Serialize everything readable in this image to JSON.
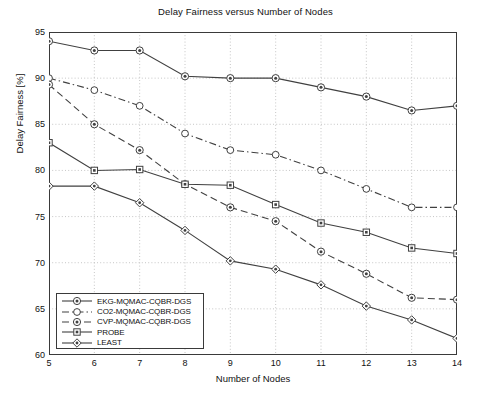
{
  "chart_data": {
    "type": "line",
    "title": "Delay Fairness versus Number of Nodes",
    "xlabel": "Number of Nodes",
    "ylabel": "Delay Fairness [%]",
    "x": [
      5,
      6,
      7,
      8,
      9,
      10,
      11,
      12,
      13,
      14
    ],
    "xlim": [
      5,
      14
    ],
    "ylim": [
      60,
      95
    ],
    "xticks": [
      "5",
      "6",
      "7",
      "8",
      "9",
      "10",
      "11",
      "12",
      "13",
      "14"
    ],
    "yticks": [
      "60",
      "65",
      "70",
      "75",
      "80",
      "85",
      "90",
      "95"
    ],
    "grid": true,
    "legend_position": "lower left",
    "series": [
      {
        "name": "EKG-MQMAC-CQBR-DGS",
        "values": [
          94.0,
          93.0,
          93.0,
          90.2,
          90.0,
          90.0,
          89.0,
          88.0,
          86.5,
          87.0
        ],
        "marker": "circle-dot",
        "linestyle": "solid",
        "color": "#404040"
      },
      {
        "name": "CO2-MQMAC-CQBR-DGS",
        "values": [
          90.0,
          88.7,
          87.0,
          84.0,
          82.2,
          81.7,
          80.0,
          78.0,
          76.0,
          76.0
        ],
        "marker": "circle-open",
        "linestyle": "dashdot",
        "color": "#404040"
      },
      {
        "name": "CVP-MQMAC-CQBR-DGS",
        "values": [
          89.3,
          85.0,
          82.2,
          78.5,
          76.0,
          74.5,
          71.2,
          68.8,
          66.2,
          66.0
        ],
        "marker": "circle-dot",
        "linestyle": "dashed",
        "color": "#404040"
      },
      {
        "name": "PROBE",
        "values": [
          83.0,
          80.0,
          80.1,
          78.5,
          78.4,
          76.3,
          74.3,
          73.3,
          71.6,
          71.0
        ],
        "marker": "square",
        "linestyle": "solid",
        "color": "#404040"
      },
      {
        "name": "LEAST",
        "values": [
          78.3,
          78.3,
          76.5,
          73.5,
          70.2,
          69.3,
          67.6,
          65.3,
          63.8,
          61.8
        ],
        "marker": "diamond",
        "linestyle": "solid",
        "color": "#404040"
      }
    ]
  },
  "style": {
    "axis_color": "#3a3a3a",
    "grid_color": "#b8b8b8",
    "line_color": "#404040",
    "background": "#ffffff"
  }
}
